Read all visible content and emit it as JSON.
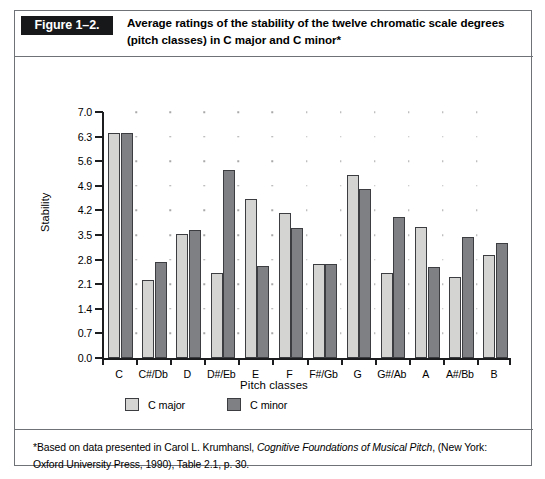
{
  "figure": {
    "number_label": "Figure 1–2.",
    "caption": "Average ratings of the stability of the twelve chromatic scale degrees (pitch classes) in C major and C minor*"
  },
  "legend": {
    "items": [
      {
        "label": "C major",
        "swatch": "light-gray-swatch",
        "color": "#d4d4d2"
      },
      {
        "label": "C minor",
        "swatch": "dark-gray-swatch",
        "color": "#7f8083"
      }
    ]
  },
  "footnote": {
    "prefix": "*Based on data presented in Carol L. Krumhansl, ",
    "italic_title": "Cognitive Foundations of Musical Pitch",
    "suffix": ", (New York: Oxford University Press, 1990), Table 2.1, p. 30."
  },
  "chart_data": {
    "type": "bar",
    "title": "Average ratings of the stability of the twelve chromatic scale degrees (pitch classes) in C major and C minor",
    "xlabel": "Pitch classes",
    "ylabel": "Stability",
    "ylim": [
      0.0,
      7.0
    ],
    "ytick_step": 0.7,
    "ytick_labels": [
      "0.0",
      "0.7",
      "1.4",
      "2.1",
      "2.8",
      "3.5",
      "4.2",
      "4.9",
      "5.6",
      "6.3",
      "7.0"
    ],
    "ytick_values": [
      0.0,
      0.7,
      1.4,
      2.1,
      2.8,
      3.5,
      4.2,
      4.9,
      5.6,
      6.3,
      7.0
    ],
    "grid": "dotted-interior-dots",
    "legend_position": "below-axis-left",
    "categories": [
      "C",
      "C#/Db",
      "D",
      "D#/Eb",
      "E",
      "F",
      "F#/Gb",
      "G",
      "G#/Ab",
      "A",
      "A#/Bb",
      "B"
    ],
    "series": [
      {
        "name": "C major",
        "color": "#d4d4d2",
        "values": [
          6.4,
          2.22,
          3.52,
          2.42,
          4.52,
          4.13,
          2.68,
          5.2,
          2.43,
          3.72,
          2.31,
          2.93
        ]
      },
      {
        "name": "C minor",
        "color": "#7f8083",
        "values": [
          6.4,
          2.72,
          3.63,
          5.35,
          2.62,
          3.7,
          2.68,
          4.8,
          4.02,
          2.6,
          3.43,
          3.27
        ]
      }
    ]
  }
}
